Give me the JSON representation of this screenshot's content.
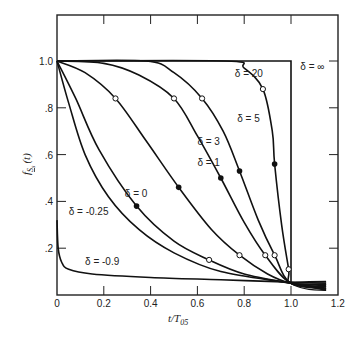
{
  "chart_data": {
    "type": "line",
    "title": "",
    "xlabel": "t/T05",
    "xlabel_main": "t/T",
    "xlabel_sub": "05",
    "ylabel": "f_Ss(t)",
    "ylabel_main": "f",
    "ylabel_sub": "S",
    "ylabel_subsub": "s",
    "ylabel_arg": "(t)",
    "xlim": [
      0,
      1.2
    ],
    "ylim": [
      0,
      1.2
    ],
    "grid": false,
    "legend": "inline labels",
    "x_ticks": [
      "0",
      "0.2",
      "0.4",
      "0.6",
      "0.8",
      "1.0",
      "1.2"
    ],
    "y_ticks": [
      "",
      ".2",
      ".4",
      ".6",
      ".8",
      "1.0"
    ],
    "series": [
      {
        "name": "δ = ∞",
        "label_pos": [
          1.04,
          0.96
        ],
        "points": [
          [
            0,
            1.0
          ],
          [
            1.0,
            1.0
          ],
          [
            1.0,
            0.05
          ]
        ],
        "open_markers": [],
        "filled_markers": []
      },
      {
        "name": "δ = 20",
        "label_pos": [
          0.76,
          0.93
        ],
        "points": [
          [
            0,
            1.0
          ],
          [
            0.72,
            1.0
          ],
          [
            0.8,
            0.97
          ],
          [
            0.88,
            0.88
          ],
          [
            0.92,
            0.7
          ],
          [
            0.93,
            0.56
          ],
          [
            0.96,
            0.3
          ],
          [
            0.99,
            0.11
          ],
          [
            1.0,
            0.05
          ],
          [
            1.15,
            0.045
          ]
        ],
        "open_markers": [
          [
            0.88,
            0.88
          ],
          [
            0.99,
            0.11
          ]
        ],
        "filled_markers": [
          [
            0.93,
            0.56
          ]
        ]
      },
      {
        "name": "δ = 5",
        "label_pos": [
          0.77,
          0.74
        ],
        "points": [
          [
            0,
            1.0
          ],
          [
            0.38,
            1.0
          ],
          [
            0.5,
            0.95
          ],
          [
            0.62,
            0.84
          ],
          [
            0.71,
            0.7
          ],
          [
            0.78,
            0.53
          ],
          [
            0.86,
            0.32
          ],
          [
            0.93,
            0.17
          ],
          [
            1.0,
            0.05
          ],
          [
            1.15,
            0.04
          ]
        ],
        "open_markers": [
          [
            0.62,
            0.84
          ],
          [
            0.93,
            0.17
          ]
        ],
        "filled_markers": [
          [
            0.78,
            0.53
          ]
        ]
      },
      {
        "name": "δ = 3",
        "label_pos": [
          0.6,
          0.64
        ],
        "points": [
          [
            0,
            1.0
          ],
          [
            0.2,
            0.99
          ],
          [
            0.35,
            0.94
          ],
          [
            0.5,
            0.84
          ],
          [
            0.6,
            0.68
          ],
          [
            0.7,
            0.5
          ],
          [
            0.8,
            0.31
          ],
          [
            0.89,
            0.17
          ],
          [
            1.0,
            0.05
          ],
          [
            1.15,
            0.035
          ]
        ],
        "open_markers": [
          [
            0.5,
            0.84
          ],
          [
            0.89,
            0.17
          ]
        ],
        "filled_markers": [
          [
            0.7,
            0.5
          ]
        ]
      },
      {
        "name": "δ = 1",
        "label_pos": [
          0.6,
          0.55
        ],
        "points": [
          [
            0,
            1.0
          ],
          [
            0.12,
            0.95
          ],
          [
            0.25,
            0.84
          ],
          [
            0.38,
            0.66
          ],
          [
            0.52,
            0.46
          ],
          [
            0.66,
            0.28
          ],
          [
            0.78,
            0.17
          ],
          [
            0.9,
            0.09
          ],
          [
            1.0,
            0.05
          ],
          [
            1.15,
            0.03
          ]
        ],
        "open_markers": [
          [
            0.25,
            0.84
          ],
          [
            0.78,
            0.17
          ]
        ],
        "filled_markers": [
          [
            0.52,
            0.46
          ]
        ]
      },
      {
        "name": "δ = 0",
        "label_pos": [
          0.29,
          0.42
        ],
        "points": [
          [
            0,
            1.0
          ],
          [
            0.08,
            0.84
          ],
          [
            0.18,
            0.62
          ],
          [
            0.34,
            0.38
          ],
          [
            0.5,
            0.23
          ],
          [
            0.65,
            0.15
          ],
          [
            0.8,
            0.09
          ],
          [
            1.0,
            0.05
          ],
          [
            1.15,
            0.025
          ]
        ],
        "open_markers": [
          [
            0.65,
            0.15
          ]
        ],
        "filled_markers": [
          [
            0.34,
            0.38
          ]
        ]
      },
      {
        "name": "δ = -0.25",
        "label_pos": [
          0.05,
          0.34
        ],
        "points": [
          [
            0,
            1.0
          ],
          [
            0.05,
            0.82
          ],
          [
            0.12,
            0.6
          ],
          [
            0.22,
            0.42
          ],
          [
            0.35,
            0.28
          ],
          [
            0.5,
            0.18
          ],
          [
            0.7,
            0.1
          ],
          [
            1.0,
            0.05
          ],
          [
            1.15,
            0.02
          ]
        ],
        "open_markers": [],
        "filled_markers": []
      },
      {
        "name": "δ = -0.9",
        "label_pos": [
          0.12,
          0.13
        ],
        "points": [
          [
            0,
            0.32
          ],
          [
            0.005,
            0.2
          ],
          [
            0.02,
            0.14
          ],
          [
            0.05,
            0.11
          ],
          [
            0.15,
            0.09
          ],
          [
            0.4,
            0.075
          ],
          [
            0.7,
            0.065
          ],
          [
            1.0,
            0.055
          ],
          [
            1.15,
            0.05
          ]
        ],
        "open_markers": [],
        "filled_markers": []
      }
    ]
  }
}
